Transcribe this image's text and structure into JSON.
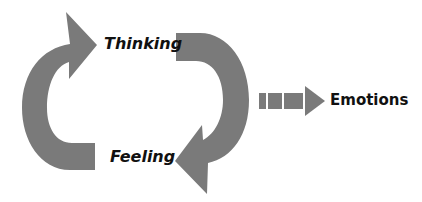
{
  "diagram": {
    "arrow_color": "#7a7a7a",
    "text_color": "#111111",
    "nodes": [
      {
        "id": "thinking",
        "label": "Thinking"
      },
      {
        "id": "feeling",
        "label": "Feeling"
      },
      {
        "id": "emotions",
        "label": "Emotions"
      }
    ],
    "edges": [
      {
        "from": "feeling",
        "to": "thinking",
        "style": "curved-arrow"
      },
      {
        "from": "thinking",
        "to": "feeling",
        "style": "curved-arrow"
      },
      {
        "from": "cycle",
        "to": "emotions",
        "style": "dashed-block-arrow"
      }
    ]
  }
}
